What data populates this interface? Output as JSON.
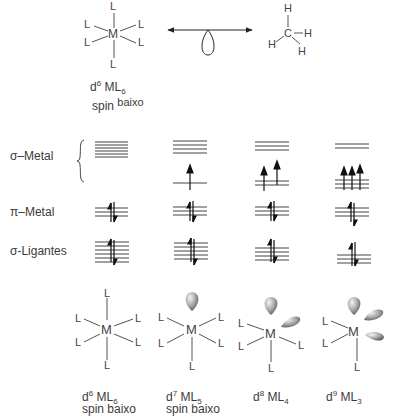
{
  "top": {
    "complex": {
      "center": "M",
      "ligand": "L",
      "caption_line1": "d",
      "caption_sup": "6",
      "caption_ml": " ML",
      "caption_sub": "6",
      "caption_line2_a": "spin",
      "caption_line2_b": "baixo"
    },
    "methyl": {
      "center": "C",
      "atom": "H"
    }
  },
  "rows": {
    "sigma_metal": "σ–Metal",
    "pi_metal": "π–Metal",
    "sigma_ligand": "σ-Ligantes"
  },
  "bottom": [
    {
      "d": "6",
      "ml": "6",
      "spin": "spin baixo"
    },
    {
      "d": "7",
      "ml": "5",
      "spin": "spin baixo"
    },
    {
      "d": "8",
      "ml": "4",
      "spin": ""
    },
    {
      "d": "9",
      "ml": "3",
      "spin": ""
    }
  ],
  "labels": {
    "d": "d",
    "ML": " ML",
    "M": "M",
    "L": "L"
  }
}
